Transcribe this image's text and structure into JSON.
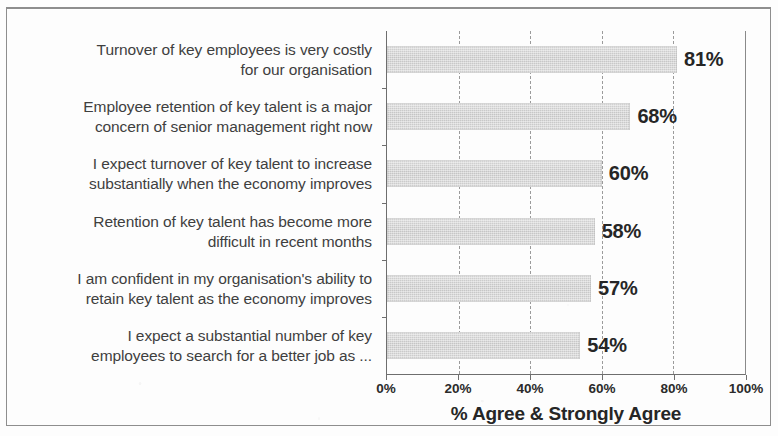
{
  "chart_data": {
    "type": "bar",
    "orientation": "horizontal",
    "title": "",
    "subtitle": "",
    "xlabel": "% Agree & Strongly Agree",
    "ylabel": "",
    "xlim": [
      0,
      100
    ],
    "xticks": [
      0,
      20,
      40,
      60,
      80,
      100
    ],
    "xtick_labels": [
      "0%",
      "20%",
      "40%",
      "60%",
      "80%",
      "100%"
    ],
    "grid": true,
    "grid_axis": "x",
    "grid_style": "dashed",
    "legend": false,
    "legend_position": "none",
    "bar_color": "#cacaca",
    "label_color": "#262626",
    "categories": [
      "Turnover of key employees is very costly\nfor our organisation",
      "Employee retention of key talent is a major\nconcern of senior management right now",
      "I expect turnover of key talent to increase\nsubstantially when the economy improves",
      "Retention of key talent has become more\ndifficult in recent months",
      "I am confident in my organisation's ability to\nretain key talent as the economy improves",
      "I expect a substantial number of key\nemployees to search for a better job as ..."
    ],
    "values": [
      81,
      68,
      60,
      58,
      57,
      54
    ],
    "data_labels": [
      "81%",
      "68%",
      "60%",
      "58%",
      "57%",
      "54%"
    ]
  }
}
